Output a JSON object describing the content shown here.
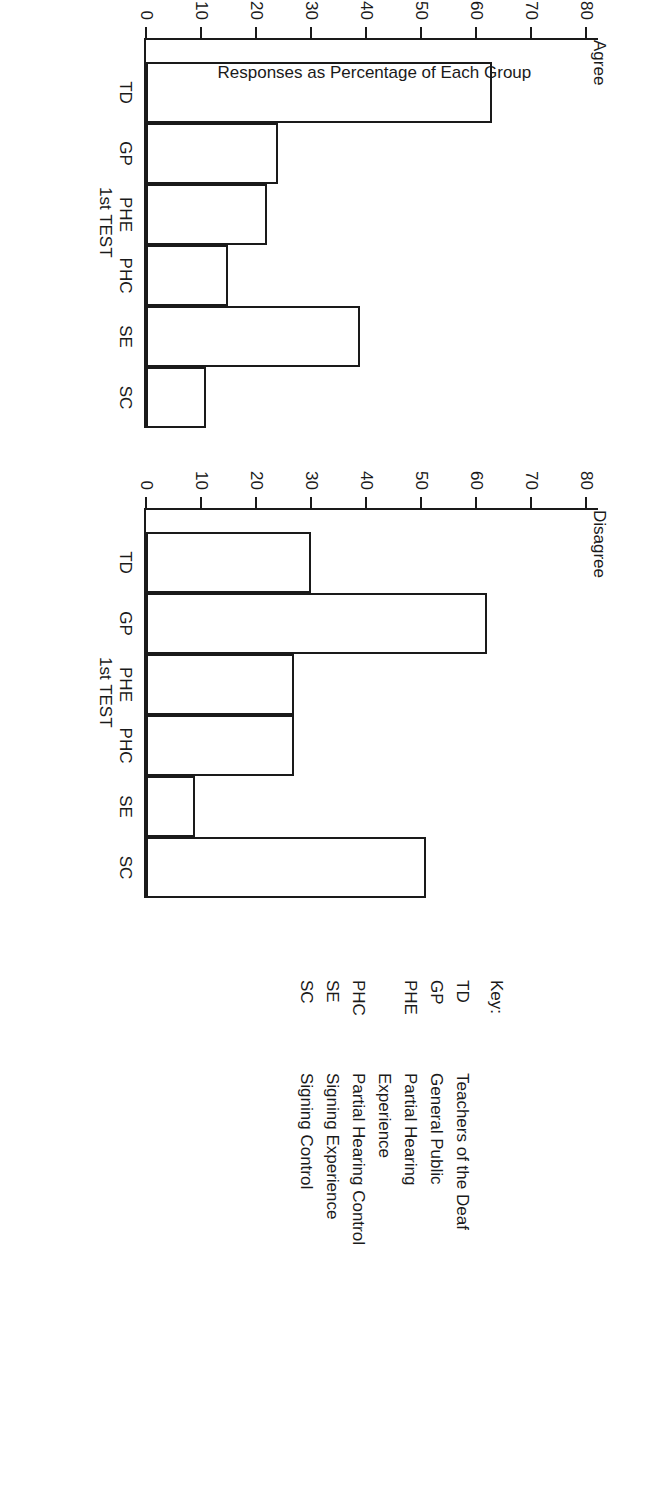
{
  "figure": {
    "y_axis_label": "Responses as Percentage of Each Group"
  },
  "key": {
    "heading": "Key:",
    "entries": [
      {
        "abbr": "TD",
        "label": "Teachers of the Deaf"
      },
      {
        "abbr": "GP",
        "label": "General Public"
      },
      {
        "abbr": "PHE",
        "label": "Partial Hearing"
      },
      {
        "abbr": "",
        "label": "Experience"
      },
      {
        "abbr": "PHC",
        "label": "Partial Hearing Control"
      },
      {
        "abbr": "SE",
        "label": "Signing Experience"
      },
      {
        "abbr": "SC",
        "label": "Signing Control"
      }
    ]
  },
  "chart_data": [
    {
      "type": "bar",
      "title": "Agree",
      "xlabel": "1st TEST",
      "ylabel": "Responses as Percentage of Each Group",
      "categories": [
        "TD",
        "GP",
        "PHE",
        "PHC",
        "SE",
        "SC"
      ],
      "values": [
        63,
        24,
        22,
        15,
        39,
        11
      ],
      "ylim": [
        0,
        85
      ],
      "yticks": [
        0,
        10,
        20,
        30,
        40,
        50,
        60,
        70,
        80
      ],
      "ytick_labels": [
        "0",
        "10",
        "20",
        "30",
        "40",
        "50",
        "60",
        "70",
        "80"
      ],
      "grid": false,
      "legend": "none"
    },
    {
      "type": "bar",
      "title": "Disagree",
      "xlabel": "1st TEST",
      "ylabel": "",
      "categories": [
        "TD",
        "GP",
        "PHE",
        "PHC",
        "SE",
        "SC"
      ],
      "values": [
        30,
        62,
        27,
        27,
        9,
        51
      ],
      "ylim": [
        0,
        85
      ],
      "yticks": [
        0,
        10,
        20,
        30,
        40,
        50,
        60,
        70,
        80
      ],
      "ytick_labels": [
        "0",
        "10",
        "20",
        "30",
        "40",
        "50",
        "60",
        "70",
        "80"
      ],
      "grid": false,
      "legend": "none"
    }
  ]
}
